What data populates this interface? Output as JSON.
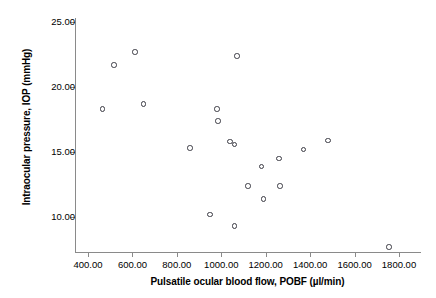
{
  "chart_data": {
    "type": "scatter",
    "title": "",
    "xlabel": "Pulsatile ocular blood flow, POBF (µl/min)",
    "ylabel": "Intraocular pressure, IOP (mmHg)",
    "xlim": [
      300,
      1860
    ],
    "ylim": [
      6.8,
      26.2
    ],
    "grid": false,
    "legend": null,
    "xticks": [
      400,
      600,
      800,
      1000,
      1200,
      1400,
      1600,
      1800
    ],
    "xtick_labels": [
      "400.00",
      "600.00",
      "800.00",
      "1000.00",
      "1200.00",
      "1400.00",
      "1600.00",
      "1800.00"
    ],
    "yticks": [
      10,
      15,
      20,
      25
    ],
    "ytick_labels": [
      "10.00",
      "15.00",
      "20.00",
      "25.00"
    ],
    "marker": "open-circle",
    "marker_color": "#3b3b44",
    "points": [
      {
        "x": 465,
        "y": 18.3
      },
      {
        "x": 517,
        "y": 21.7
      },
      {
        "x": 612,
        "y": 22.7
      },
      {
        "x": 650,
        "y": 18.7
      },
      {
        "x": 860,
        "y": 15.3
      },
      {
        "x": 950,
        "y": 10.2
      },
      {
        "x": 980,
        "y": 18.3
      },
      {
        "x": 985,
        "y": 17.4
      },
      {
        "x": 1040,
        "y": 15.8
      },
      {
        "x": 1060,
        "y": 15.6
      },
      {
        "x": 1060,
        "y": 9.3
      },
      {
        "x": 1070,
        "y": 22.4
      },
      {
        "x": 1120,
        "y": 12.4
      },
      {
        "x": 1180,
        "y": 13.9
      },
      {
        "x": 1190,
        "y": 11.4
      },
      {
        "x": 1260,
        "y": 14.5
      },
      {
        "x": 1265,
        "y": 12.4
      },
      {
        "x": 1370,
        "y": 15.2
      },
      {
        "x": 1480,
        "y": 15.9
      },
      {
        "x": 1755,
        "y": 7.7
      }
    ]
  },
  "axes": {
    "x_title": "Pulsatile ocular blood flow, POBF (µl/min)",
    "y_title": "Intraocular pressure, IOP (mmHg)"
  },
  "colors": {
    "axis": "#8a8a8a",
    "marker": "#3b3b44",
    "text": "#000000",
    "background": "#ffffff"
  }
}
